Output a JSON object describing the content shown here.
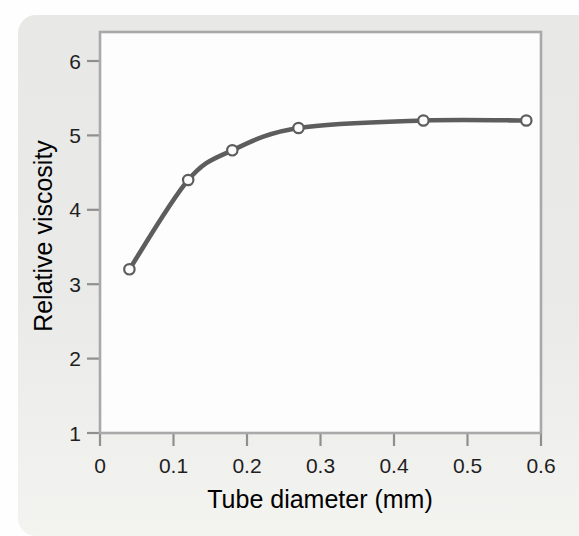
{
  "chart_data": {
    "type": "line",
    "title": "",
    "xlabel": "Tube diameter (mm)",
    "ylabel": "Relative viscosity",
    "x": [
      0.04,
      0.12,
      0.18,
      0.27,
      0.44,
      0.58
    ],
    "y": [
      3.2,
      4.4,
      4.8,
      5.1,
      5.2,
      5.2
    ],
    "xlim": [
      0,
      0.6
    ],
    "ylim": [
      1,
      6
    ],
    "x_ticks": [
      {
        "value": 0,
        "label": "0"
      },
      {
        "value": 0.1,
        "label": "0.1"
      },
      {
        "value": 0.2,
        "label": "0.2"
      },
      {
        "value": 0.3,
        "label": "0.3"
      },
      {
        "value": 0.4,
        "label": "0.4"
      },
      {
        "value": 0.5,
        "label": "0.5"
      },
      {
        "value": 0.6,
        "label": "0.6"
      }
    ],
    "y_ticks": [
      {
        "value": 1,
        "label": "1"
      },
      {
        "value": 2,
        "label": "2"
      },
      {
        "value": 3,
        "label": "3"
      },
      {
        "value": 4,
        "label": "4"
      },
      {
        "value": 5,
        "label": "5"
      },
      {
        "value": 6,
        "label": "6"
      }
    ],
    "grid": false,
    "legend": "none",
    "marker": "open-circle"
  },
  "colors": {
    "panel_background": "#e9e9e7",
    "plot_background": "#fdfdfd",
    "frame": "#a9a9a9",
    "tick": "#8f8f8f",
    "curve": "#5d5d5d",
    "marker_fill": "#fcfcfc",
    "text": "#1f1f1f"
  }
}
